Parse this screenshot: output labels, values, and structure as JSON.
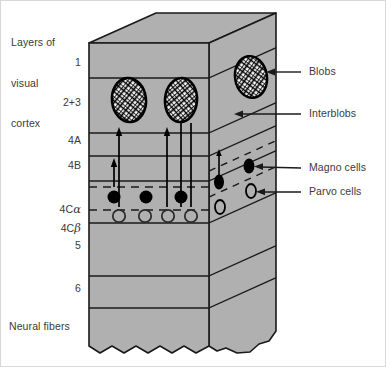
{
  "figure": {
    "title": "Layers of visual cortex",
    "title_lines": [
      "Layers of",
      "visual",
      "cortex"
    ],
    "bottom_label": "Neural fibers",
    "colors": {
      "block_fill": "#b0b0b0",
      "outline": "#1a1a1a",
      "text": "#3a3a3a",
      "background": "#ffffff",
      "blob_fill": "#ffffff",
      "magno_fill": "#000000",
      "parvo_fill": "#b0b0b0"
    }
  },
  "layer_labels": [
    {
      "id": "layer-1",
      "text": "1",
      "greek": ""
    },
    {
      "id": "layer-2-3",
      "text": "2+3",
      "greek": ""
    },
    {
      "id": "layer-4a",
      "text": "4A",
      "greek": ""
    },
    {
      "id": "layer-4b",
      "text": "4B",
      "greek": ""
    },
    {
      "id": "layer-4c-alpha",
      "text": "4C",
      "greek": "α"
    },
    {
      "id": "layer-4c-beta",
      "text": "4C",
      "greek": "β"
    },
    {
      "id": "layer-5",
      "text": "5",
      "greek": ""
    },
    {
      "id": "layer-6",
      "text": "6",
      "greek": ""
    }
  ],
  "callouts": [
    {
      "id": "blobs",
      "text": "Blobs"
    },
    {
      "id": "interblobs",
      "text": "Interblobs"
    },
    {
      "id": "magno-cells",
      "text": "Magno cells"
    },
    {
      "id": "parvo-cells",
      "text": "Parvo cells"
    }
  ],
  "diagram_content": {
    "type": "anatomical-schematic",
    "description": "Cutaway block of primary visual cortex showing laminar layers, cytochrome-oxidase blobs in layers 2+3, and magnocellular / parvocellular inputs terminating in 4C alpha and 4C beta.",
    "blobs_count_front": 2,
    "blobs_count_side": 1,
    "magno_cells_front": 3,
    "parvo_cells_front": 4,
    "magno_cells_side": 2,
    "parvo_cells_side": 2
  }
}
